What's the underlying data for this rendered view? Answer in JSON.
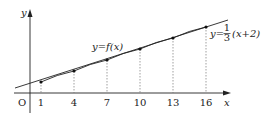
{
  "diagram": {
    "axes": {
      "x_label": "x",
      "y_label": "y",
      "origin_label": "O",
      "x_ticks": [
        "1",
        "4",
        "7",
        "10",
        "13",
        "16"
      ]
    },
    "curve_label": "y=f(x)",
    "line_label": {
      "prefix": "y=",
      "numerator": "1",
      "denominator": "3",
      "suffix": "(x+2)"
    },
    "points": [
      {
        "x": 1,
        "y": 1
      },
      {
        "x": 4,
        "y": 2
      },
      {
        "x": 7,
        "y": 3
      },
      {
        "x": 10,
        "y": 4
      },
      {
        "x": 13,
        "y": 5
      },
      {
        "x": 16,
        "y": 6
      }
    ],
    "colors": {
      "ink": "#222222",
      "dashed": "#777777"
    }
  }
}
